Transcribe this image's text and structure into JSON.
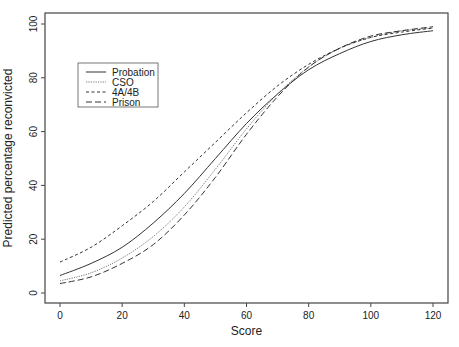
{
  "chart_data": {
    "type": "line",
    "title": "",
    "xlabel": "Score",
    "ylabel": "Predicted percentage reconvicted",
    "xlim": [
      0,
      120
    ],
    "ylim": [
      0,
      100
    ],
    "xticks": [
      0,
      20,
      40,
      60,
      80,
      100,
      120
    ],
    "yticks": [
      0,
      20,
      40,
      60,
      80,
      100
    ],
    "grid": false,
    "legend_position": "upper left (inset)",
    "x": [
      0,
      10,
      20,
      30,
      40,
      50,
      60,
      70,
      80,
      90,
      100,
      110,
      120
    ],
    "series": [
      {
        "name": "Probation",
        "style": "solid",
        "values": [
          6.5,
          11,
          17,
          26,
          37,
          50,
          63,
          74,
          83,
          89,
          93.5,
          96,
          97.5
        ]
      },
      {
        "name": "CSO",
        "style": "dotted",
        "values": [
          4.5,
          7.5,
          13,
          21,
          32,
          46,
          61,
          74,
          84,
          91,
          95,
          97.5,
          98.5
        ]
      },
      {
        "name": "4A/4B",
        "style": "short-dash",
        "values": [
          11.5,
          17,
          25,
          34,
          45,
          56,
          67,
          77,
          85,
          91,
          95,
          97,
          98.5
        ]
      },
      {
        "name": "Prison",
        "style": "long-dash",
        "values": [
          3.5,
          6,
          11,
          18,
          29,
          43,
          59,
          73,
          84,
          91,
          95.5,
          97.5,
          99
        ]
      }
    ]
  },
  "legend": {
    "items": [
      {
        "label": "Probation"
      },
      {
        "label": "CSO"
      },
      {
        "label": "4A/4B"
      },
      {
        "label": "Prison"
      }
    ]
  },
  "axes": {
    "xlabel": "Score",
    "ylabel": "Predicted percentage reconvicted",
    "xticks": [
      "0",
      "20",
      "40",
      "60",
      "80",
      "100",
      "120"
    ],
    "yticks": [
      "0",
      "20",
      "40",
      "60",
      "80",
      "100"
    ]
  }
}
